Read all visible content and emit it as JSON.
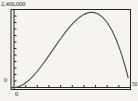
{
  "figure": {
    "axis_labels": {
      "ymax": "2,400,000",
      "yzero": "0",
      "xzero": "0",
      "xmax": "50"
    }
  },
  "colors": {
    "background": "#f6f4f0",
    "frame": "#26241f",
    "axis": "#26241f",
    "curve": "#4b4a48",
    "text": "#33302c"
  },
  "chart_data": {
    "type": "line",
    "title": "",
    "xlabel": "",
    "ylabel": "",
    "xlim": [
      0,
      50
    ],
    "ylim": [
      0,
      2400000
    ],
    "xscl": 5,
    "yscl": 200000,
    "grid": false,
    "legend": null,
    "frame_box": true,
    "axes_inside_frame": true,
    "series": [
      {
        "name": "curve",
        "points": [
          [
            0,
            0
          ],
          [
            2,
            24000
          ],
          [
            4,
            92000
          ],
          [
            6,
            198000
          ],
          [
            8,
            336000
          ],
          [
            10,
            500000
          ],
          [
            12,
            684000
          ],
          [
            14,
            882000
          ],
          [
            16,
            1088000
          ],
          [
            18,
            1296000
          ],
          [
            20,
            1500000
          ],
          [
            22,
            1694000
          ],
          [
            24,
            1872000
          ],
          [
            26,
            2028000
          ],
          [
            28,
            2156000
          ],
          [
            30,
            2250000
          ],
          [
            32,
            2304000
          ],
          [
            33.3,
            2315000
          ],
          [
            34,
            2312000
          ],
          [
            36,
            2268000
          ],
          [
            38,
            2166000
          ],
          [
            40,
            2000000
          ],
          [
            42,
            1764000
          ],
          [
            44,
            1452000
          ],
          [
            46,
            1058000
          ],
          [
            48,
            576000
          ],
          [
            49,
            300000
          ]
        ]
      }
    ]
  }
}
